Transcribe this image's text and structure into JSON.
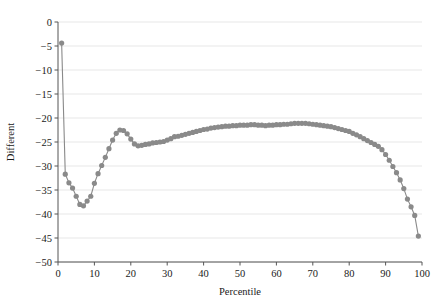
{
  "chart_data": {
    "type": "line",
    "title": "",
    "subtitle": "",
    "xlabel": "Percentile",
    "ylabel": "Different",
    "xlim": [
      0,
      100
    ],
    "ylim": [
      -50,
      0
    ],
    "xticks": [
      0,
      10,
      20,
      30,
      40,
      50,
      60,
      70,
      80,
      90,
      100
    ],
    "yticks": [
      0,
      -5,
      -10,
      -15,
      -20,
      -25,
      -30,
      -35,
      -40,
      -45,
      -50
    ],
    "xtick_labels": [
      "0",
      "10",
      "20",
      "30",
      "40",
      "50",
      "60",
      "70",
      "80",
      "90",
      "100"
    ],
    "ytick_labels": [
      "0",
      "−5",
      "−10",
      "−15",
      "−20",
      "−25",
      "−30",
      "−35",
      "−40",
      "−45",
      "−50"
    ],
    "grid": {
      "horizontal": true,
      "vertical": false,
      "color": "#dcdcdc"
    },
    "legend": {
      "visible": false,
      "position": "none",
      "entries": []
    },
    "annotations": [],
    "series": [
      {
        "name": "Different",
        "color": "#8a8a8a",
        "marker": "circle",
        "marker_size": 2.6,
        "line_width": 1.1,
        "x": [
          1,
          2,
          3,
          4,
          5,
          6,
          7,
          8,
          9,
          10,
          11,
          12,
          13,
          14,
          15,
          16,
          17,
          18,
          19,
          20,
          21,
          22,
          23,
          24,
          25,
          26,
          27,
          28,
          29,
          30,
          31,
          32,
          33,
          34,
          35,
          36,
          37,
          38,
          39,
          40,
          41,
          42,
          43,
          44,
          45,
          46,
          47,
          48,
          49,
          50,
          51,
          52,
          53,
          54,
          55,
          56,
          57,
          58,
          59,
          60,
          61,
          62,
          63,
          64,
          65,
          66,
          67,
          68,
          69,
          70,
          71,
          72,
          73,
          74,
          75,
          76,
          77,
          78,
          79,
          80,
          81,
          82,
          83,
          84,
          85,
          86,
          87,
          88,
          89,
          90,
          91,
          92,
          93,
          94,
          95,
          96,
          97,
          98,
          99
        ],
        "y": [
          -4.4,
          -31.7,
          -33.5,
          -34.6,
          -36.3,
          -38.0,
          -38.3,
          -37.3,
          -36.3,
          -33.6,
          -31.6,
          -29.9,
          -28.2,
          -26.4,
          -24.6,
          -23.2,
          -22.5,
          -22.6,
          -23.3,
          -24.4,
          -25.4,
          -25.8,
          -25.7,
          -25.5,
          -25.4,
          -25.2,
          -25.1,
          -25.0,
          -24.9,
          -24.6,
          -24.3,
          -23.9,
          -23.8,
          -23.6,
          -23.4,
          -23.2,
          -23.0,
          -22.8,
          -22.6,
          -22.4,
          -22.3,
          -22.1,
          -22.0,
          -21.9,
          -21.8,
          -21.7,
          -21.7,
          -21.6,
          -21.6,
          -21.5,
          -21.5,
          -21.5,
          -21.4,
          -21.4,
          -21.5,
          -21.5,
          -21.6,
          -21.5,
          -21.5,
          -21.4,
          -21.4,
          -21.3,
          -21.3,
          -21.2,
          -21.1,
          -21.1,
          -21.1,
          -21.1,
          -21.2,
          -21.3,
          -21.4,
          -21.5,
          -21.6,
          -21.7,
          -21.8,
          -22.0,
          -22.2,
          -22.4,
          -22.6,
          -22.8,
          -23.2,
          -23.5,
          -23.9,
          -24.3,
          -24.7,
          -25.1,
          -25.5,
          -25.9,
          -26.6,
          -27.6,
          -28.8,
          -30.1,
          -31.4,
          -32.9,
          -34.7,
          -36.9,
          -38.5,
          -40.3,
          -44.6
        ]
      }
    ]
  },
  "axes": {
    "x_axis_name": "percentile-axis",
    "y_axis_name": "different-axis"
  }
}
